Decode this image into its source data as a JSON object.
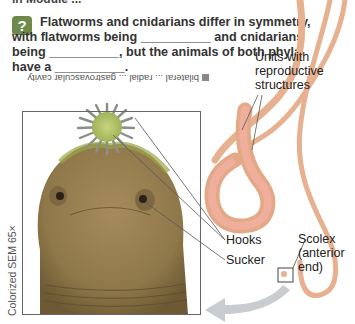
{
  "page": {
    "cut_off_top_text": "in Module ...",
    "question": {
      "icon": "question-icon",
      "icon_glyph": "?",
      "badge_color": "#6e8a4a",
      "text": "Flatworms and cnidarians differ in symmetry, with flatworms being __________ and cnidarians being __________, but the animals of both phyla have a __________."
    },
    "answer_upside_down": "bilateral ... radial ... gastrovascular cavity"
  },
  "figure": {
    "photo_caption": "Colorized SEM 65×",
    "labels": {
      "units": "Units with reproductive structures",
      "hooks": "Hooks",
      "sucker": "Sucker",
      "scolex": "Scolex (anterior end)"
    },
    "colors": {
      "worm_body": "#e7b08f",
      "worm_segments": "#f0a49a",
      "head_photo": "#9c8456",
      "hook_crown": "#b6c56c",
      "arrow": "#c9cdd0"
    }
  }
}
